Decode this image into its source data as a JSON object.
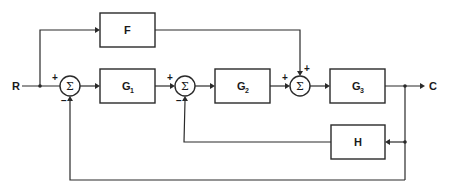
{
  "diagram": {
    "type": "control-system-block-diagram",
    "signals": {
      "input": "R",
      "output": "C"
    },
    "blocks": [
      {
        "id": "F",
        "label": "F",
        "sub": ""
      },
      {
        "id": "G1",
        "label": "G",
        "sub": "1"
      },
      {
        "id": "G2",
        "label": "G",
        "sub": "2"
      },
      {
        "id": "G3",
        "label": "G",
        "sub": "3"
      },
      {
        "id": "H",
        "label": "H",
        "sub": ""
      }
    ],
    "summers": [
      {
        "id": "S1",
        "symbol": "Σ",
        "signs": {
          "left": "+",
          "bottom": "−"
        }
      },
      {
        "id": "S2",
        "symbol": "Σ",
        "signs": {
          "left": "+",
          "bottom": "−"
        }
      },
      {
        "id": "S3",
        "symbol": "Σ",
        "signs": {
          "left": "+",
          "top": "+"
        }
      }
    ],
    "connections": [
      "R -> S1(+)",
      "R -> F",
      "S1 -> G1",
      "G1 -> S2(+)",
      "S2 -> G2",
      "G2 -> S3(+)",
      "F -> S3(+)",
      "S3 -> G3",
      "G3 -> C",
      "C -> H -> S2(−)",
      "C -> S1(−)"
    ],
    "colors": {
      "line": "#2a2a2a",
      "background": "#ffffff"
    }
  }
}
